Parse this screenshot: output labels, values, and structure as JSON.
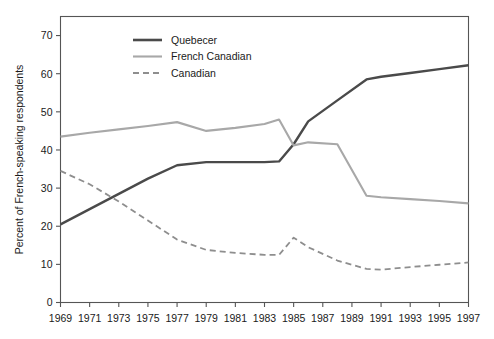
{
  "chart_data": {
    "type": "line",
    "title": "",
    "xlabel": "",
    "ylabel": "Percent of French-speaking respondents",
    "xlim": [
      1969,
      1997
    ],
    "ylim": [
      0,
      75
    ],
    "grid": false,
    "legend_position": "top-center",
    "x_tick_labels": [
      "1969",
      "1971",
      "1973",
      "1975",
      "1977",
      "1979",
      "1981",
      "1983",
      "1985",
      "1987",
      "1989",
      "1991",
      "1993",
      "1995",
      "1997"
    ],
    "x_ticks": [
      1969,
      1971,
      1973,
      1975,
      1977,
      1979,
      1981,
      1983,
      1985,
      1987,
      1989,
      1991,
      1993,
      1995,
      1997
    ],
    "y_tick_labels": [
      "0",
      "10",
      "20",
      "30",
      "40",
      "50",
      "60",
      "70"
    ],
    "y_ticks": [
      0,
      10,
      20,
      30,
      40,
      50,
      60,
      70
    ],
    "x": [
      1969,
      1971,
      1973,
      1975,
      1977,
      1979,
      1981,
      1983,
      1984,
      1985,
      1986,
      1988,
      1990,
      1991,
      1993,
      1995,
      1997
    ],
    "series": [
      {
        "name": "Quebecer",
        "color": "#4a4a4a",
        "style": "solid",
        "width": 2.4,
        "values": [
          20.5,
          24.5,
          28.5,
          32.5,
          36.0,
          36.8,
          36.8,
          36.8,
          37.0,
          41.5,
          47.5,
          53.0,
          58.5,
          59.2,
          60.2,
          61.2,
          62.2
        ]
      },
      {
        "name": "French Canadian",
        "color": "#a8a8a8",
        "style": "solid",
        "width": 2.1,
        "values": [
          43.5,
          44.5,
          45.4,
          46.3,
          47.3,
          45.0,
          45.8,
          46.8,
          48.0,
          41.2,
          42.0,
          41.5,
          28.0,
          27.6,
          27.1,
          26.6,
          26.0
        ]
      },
      {
        "name": "Canadian",
        "color": "#8e8e8e",
        "style": "dashed",
        "width": 1.8,
        "values": [
          34.5,
          31.0,
          26.5,
          21.5,
          16.5,
          13.8,
          13.0,
          12.5,
          12.5,
          17.0,
          14.5,
          11.0,
          8.8,
          8.6,
          9.3,
          9.9,
          10.5
        ]
      }
    ],
    "legend": [
      {
        "label": "Quebecer",
        "color": "#4a4a4a",
        "style": "solid",
        "width": 2.6
      },
      {
        "label": "French Canadian",
        "color": "#a8a8a8",
        "style": "solid",
        "width": 2.1
      },
      {
        "label": "Canadian",
        "color": "#8e8e8e",
        "style": "dashed",
        "width": 1.8
      }
    ]
  }
}
